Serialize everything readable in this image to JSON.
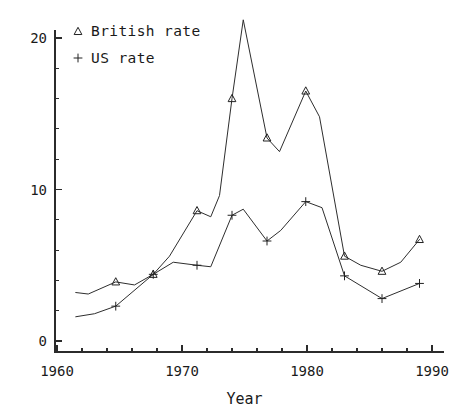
{
  "chart_data": {
    "type": "line",
    "title": "",
    "subtitle": "",
    "xlabel": "Year",
    "ylabel": "",
    "xlim": [
      1960,
      1990
    ],
    "ylim": [
      0,
      21.5
    ],
    "grid": false,
    "legend_position": "top-left",
    "x_ticks_major": [
      1960,
      1970,
      1980,
      1990
    ],
    "x_tick_labels": [
      "1960",
      "1970",
      "1980",
      "1990"
    ],
    "x_minor_step": 2,
    "y_ticks_major": [
      0,
      10,
      20
    ],
    "y_tick_labels": [
      "0",
      "10",
      "20"
    ],
    "y_minor_step": 2,
    "series": [
      {
        "name": "British rate",
        "marker": "triangle",
        "legend_symbol": "△",
        "color": "#2e2e2e",
        "x": [
          1961.5,
          1962.5,
          1964.7,
          1966.2,
          1967.7,
          1969.0,
          1971.2,
          1972.3,
          1973.0,
          1974.0,
          1974.9,
          1976.8,
          1977.8,
          1979.9,
          1981.0,
          1983.0,
          1984.3,
          1986.0,
          1987.5,
          1989.0
        ],
        "y": [
          3.2,
          3.1,
          3.9,
          3.7,
          4.4,
          5.6,
          8.6,
          8.2,
          9.6,
          16.0,
          21.2,
          13.4,
          12.5,
          16.5,
          14.8,
          5.6,
          5.0,
          4.6,
          5.2,
          6.7
        ],
        "markers_x": [
          1964.7,
          1967.7,
          1971.2,
          1974.0,
          1976.8,
          1979.9,
          1983.0,
          1986.0,
          1989.0
        ],
        "markers_y": [
          3.9,
          4.4,
          8.6,
          16.0,
          13.4,
          16.5,
          5.6,
          4.6,
          6.7
        ]
      },
      {
        "name": "US rate",
        "marker": "plus",
        "legend_symbol": "+",
        "color": "#2e2e2e",
        "x": [
          1961.5,
          1963.0,
          1964.7,
          1967.7,
          1969.3,
          1971.2,
          1972.3,
          1974.0,
          1974.9,
          1976.8,
          1977.9,
          1979.9,
          1981.2,
          1983.0,
          1986.0,
          1989.0
        ],
        "y": [
          1.6,
          1.8,
          2.3,
          4.4,
          5.2,
          5.0,
          4.9,
          8.3,
          8.7,
          6.6,
          7.3,
          9.2,
          8.8,
          4.3,
          2.8,
          3.8
        ],
        "markers_x": [
          1964.7,
          1967.7,
          1971.2,
          1974.0,
          1976.8,
          1979.9,
          1983.0,
          1986.0,
          1989.0
        ],
        "markers_y": [
          2.3,
          4.4,
          5.0,
          8.3,
          6.6,
          9.2,
          4.3,
          2.8,
          3.8
        ]
      }
    ]
  },
  "legend": {
    "entries": [
      {
        "symbol": "△",
        "label": "British rate"
      },
      {
        "symbol": "+",
        "label": "US rate"
      }
    ]
  },
  "axes": {
    "x_title": "Year"
  },
  "colors": {
    "ink": "#2e2e2e",
    "background": "#ffffff"
  }
}
